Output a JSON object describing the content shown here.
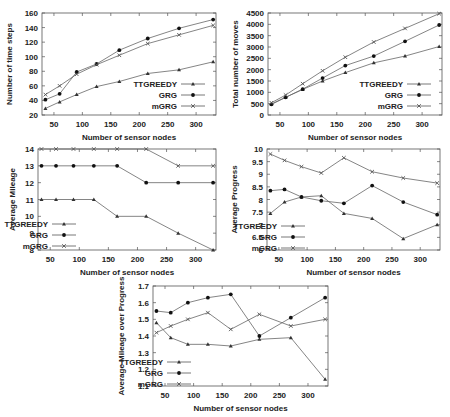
{
  "chart_data": [
    {
      "type": "line",
      "title": "",
      "xlabel": "Number of sensor nodes",
      "ylabel": "Number of time steps",
      "x": [
        35,
        60,
        90,
        125,
        165,
        215,
        270,
        330
      ],
      "xlim": [
        29,
        335
      ],
      "ylim": [
        20,
        160
      ],
      "xticks": [
        50,
        100,
        150,
        200,
        250,
        300
      ],
      "yticks": [
        20,
        40,
        60,
        80,
        100,
        120,
        140,
        160
      ],
      "legend_position": "lower right",
      "grid": false,
      "series": [
        {
          "name": "TTGREEDY",
          "marker": "triangle",
          "values": [
            29,
            38,
            48,
            59,
            66,
            77,
            82,
            93
          ]
        },
        {
          "name": "GRG",
          "marker": "circle",
          "values": [
            41,
            49,
            79,
            90,
            109,
            125,
            139,
            151
          ]
        },
        {
          "name": "mGRG",
          "marker": "x",
          "values": [
            48,
            60,
            76,
            89,
            102,
            118,
            130,
            143
          ]
        }
      ]
    },
    {
      "type": "line",
      "title": "",
      "xlabel": "Number of sensor nodes",
      "ylabel": "Total number of moves",
      "x": [
        35,
        60,
        90,
        125,
        165,
        215,
        270,
        330
      ],
      "xlim": [
        29,
        335
      ],
      "ylim": [
        0,
        4500
      ],
      "xticks": [
        50,
        100,
        150,
        200,
        250,
        300
      ],
      "yticks": [
        0,
        500,
        1000,
        1500,
        2000,
        2500,
        3000,
        3500,
        4000,
        4500
      ],
      "legend_position": "lower right",
      "grid": false,
      "series": [
        {
          "name": "TTGREEDY",
          "marker": "triangle",
          "values": [
            480,
            780,
            1130,
            1500,
            1870,
            2300,
            2600,
            3020
          ]
        },
        {
          "name": "GRG",
          "marker": "circle",
          "values": [
            470,
            780,
            1140,
            1630,
            2180,
            2600,
            3250,
            3970
          ]
        },
        {
          "name": "mGRG",
          "marker": "x",
          "values": [
            540,
            880,
            1380,
            1950,
            2550,
            3220,
            3820,
            4470
          ]
        }
      ]
    },
    {
      "type": "line",
      "title": "",
      "xlabel": "Number of sensor nodes",
      "ylabel": "Average Mileage",
      "x": [
        35,
        60,
        90,
        125,
        165,
        215,
        270,
        330
      ],
      "xlim": [
        29,
        335
      ],
      "ylim": [
        8,
        14
      ],
      "xticks": [
        50,
        100,
        150,
        200,
        250,
        300
      ],
      "yticks": [
        8,
        9,
        10,
        11,
        12,
        13,
        14
      ],
      "legend_position": "lower left",
      "grid": false,
      "series": [
        {
          "name": "TTGREEDY",
          "marker": "triangle",
          "values": [
            11,
            11,
            11,
            11,
            10,
            10,
            9,
            8
          ]
        },
        {
          "name": "GRG",
          "marker": "circle",
          "values": [
            13,
            13,
            13,
            13,
            13,
            12,
            12,
            12
          ]
        },
        {
          "name": "mGRG",
          "marker": "x",
          "values": [
            14,
            14,
            14,
            14,
            14,
            14,
            13,
            13
          ]
        }
      ]
    },
    {
      "type": "line",
      "title": "",
      "xlabel": "Number of sensor nodes",
      "ylabel": "Average Progress",
      "x": [
        35,
        60,
        90,
        125,
        165,
        215,
        270,
        330
      ],
      "xlim": [
        29,
        335
      ],
      "ylim": [
        6,
        10
      ],
      "xticks": [
        50,
        100,
        150,
        200,
        250,
        300
      ],
      "yticks": [
        6,
        6.5,
        7,
        7.5,
        8,
        8.5,
        9,
        9.5,
        10
      ],
      "legend_position": "lower left",
      "grid": false,
      "series": [
        {
          "name": "TTGREEDY",
          "marker": "triangle",
          "values": [
            7.45,
            7.9,
            8.1,
            8.15,
            7.45,
            7.25,
            6.45,
            7.0
          ]
        },
        {
          "name": "GRG",
          "marker": "circle",
          "values": [
            8.35,
            8.4,
            8.1,
            7.95,
            7.85,
            8.55,
            7.9,
            7.4
          ]
        },
        {
          "name": "mGRG",
          "marker": "x",
          "values": [
            9.8,
            9.55,
            9.3,
            9.05,
            9.65,
            9.1,
            8.85,
            8.65
          ]
        }
      ]
    },
    {
      "type": "line",
      "title": "",
      "xlabel": "Number of sensor nodes",
      "ylabel": "Average Mileage over Progress",
      "x": [
        35,
        60,
        90,
        125,
        165,
        215,
        270,
        330
      ],
      "xlim": [
        29,
        335
      ],
      "ylim": [
        1.1,
        1.7
      ],
      "xticks": [
        50,
        100,
        150,
        200,
        250,
        300
      ],
      "yticks": [
        1.1,
        1.2,
        1.3,
        1.4,
        1.5,
        1.6,
        1.7
      ],
      "legend_position": "lower left",
      "grid": false,
      "series": [
        {
          "name": "TTGREEDY",
          "marker": "triangle",
          "values": [
            1.48,
            1.39,
            1.35,
            1.35,
            1.34,
            1.38,
            1.39,
            1.14
          ]
        },
        {
          "name": "GRG",
          "marker": "circle",
          "values": [
            1.55,
            1.54,
            1.6,
            1.63,
            1.65,
            1.4,
            1.51,
            1.63
          ]
        },
        {
          "name": "mGRG",
          "marker": "x",
          "values": [
            1.42,
            1.46,
            1.5,
            1.54,
            1.44,
            1.53,
            1.46,
            1.5
          ]
        }
      ]
    }
  ],
  "layout": [
    {
      "left": 42,
      "top": 13,
      "right": 216,
      "bottom": 115,
      "legend": {
        "x": 205,
        "y": 84,
        "align": "right"
      }
    },
    {
      "left": 268,
      "top": 13,
      "right": 442,
      "bottom": 115,
      "legend": {
        "x": 431,
        "y": 84,
        "align": "right"
      }
    },
    {
      "left": 38,
      "top": 149,
      "right": 216,
      "bottom": 250,
      "legend": {
        "x": 76,
        "y": 224,
        "align": "right"
      }
    },
    {
      "left": 267,
      "top": 149,
      "right": 440,
      "bottom": 250,
      "legend": {
        "x": 305,
        "y": 226,
        "align": "right"
      }
    },
    {
      "left": 153,
      "top": 286,
      "right": 328,
      "bottom": 386,
      "legend": {
        "x": 191,
        "y": 362,
        "align": "right"
      }
    }
  ]
}
